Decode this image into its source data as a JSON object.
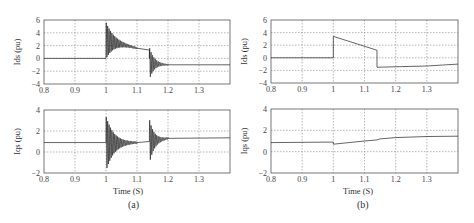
{
  "chart_data": [
    {
      "id": "a-ids",
      "panel": "(a)",
      "type": "line",
      "ylabel": "Ids (pu)",
      "xlabel": "",
      "xlim": [
        0.8,
        1.4
      ],
      "ylim": [
        -4,
        6
      ],
      "xticks": [
        0.8,
        0.9,
        1,
        1.1,
        1.2,
        1.3
      ],
      "xtick_labels": [
        "0.8",
        "0.9",
        "1",
        "1.1",
        "1.2",
        "1.3"
      ],
      "yticks": [
        -4,
        -2,
        0,
        2,
        4,
        6
      ],
      "grid": true,
      "box": {
        "x": 44,
        "y": 20,
        "w": 186,
        "h": 64
      },
      "description": "Steady 0 until t=1.0; oscillation (peaks ~5.5 / ~0) decaying around a line from ~3.5 to ~1.5 by t≈1.1; ramp to ~1.3 at t≈1.14; then oscillation down to ~-3.5 decaying to ~-1.0 by t≈1.2; flat ~-1.0 to 1.4",
      "segments": [
        {
          "kind": "line",
          "points": [
            [
              0.8,
              0
            ],
            [
              1.0,
              0
            ]
          ]
        },
        {
          "kind": "osc",
          "t0": 1.0,
          "t1": 1.1,
          "start_center": 2.8,
          "end_center": 1.6,
          "amp0": 2.8,
          "amp1": 0.1,
          "freq": 220
        },
        {
          "kind": "line",
          "points": [
            [
              1.1,
              1.6
            ],
            [
              1.14,
              1.3
            ]
          ]
        },
        {
          "kind": "osc",
          "t0": 1.14,
          "t1": 1.2,
          "start_center": -0.8,
          "end_center": -1.0,
          "amp0": 2.5,
          "amp1": 0.05,
          "freq": 220
        },
        {
          "kind": "line",
          "points": [
            [
              1.2,
              -1.0
            ],
            [
              1.4,
              -1.0
            ]
          ]
        }
      ]
    },
    {
      "id": "a-iqs",
      "panel": "(a)",
      "type": "line",
      "ylabel": "Iqs (pu)",
      "xlabel": "Time (S)",
      "xlim": [
        0.8,
        1.4
      ],
      "ylim": [
        -2,
        4
      ],
      "xticks": [
        0.8,
        0.9,
        1,
        1.1,
        1.2,
        1.3
      ],
      "xtick_labels": [
        "0.8",
        "0.9",
        "1",
        "1.1",
        "1.2",
        "1.3"
      ],
      "yticks": [
        -2,
        0,
        2,
        4
      ],
      "grid": true,
      "box": {
        "x": 44,
        "y": 110,
        "w": 186,
        "h": 63
      },
      "description": "Steady ~0.9 until t=1.0; oscillation (peaks ~3.4 / ~-1.8) decaying to ~0.9 by t≈1.1; flat to 1.14; oscillation (peaks ~3.1 / ~-1.2) decaying to ~1.3 by 1.2; ~1.35 to 1.4",
      "segments": [
        {
          "kind": "line",
          "points": [
            [
              0.8,
              0.9
            ],
            [
              1.0,
              0.9
            ]
          ]
        },
        {
          "kind": "osc",
          "t0": 1.0,
          "t1": 1.1,
          "start_center": 0.8,
          "end_center": 0.9,
          "amp0": 2.6,
          "amp1": 0.05,
          "freq": 220
        },
        {
          "kind": "line",
          "points": [
            [
              1.1,
              0.9
            ],
            [
              1.14,
              1.0
            ]
          ]
        },
        {
          "kind": "osc",
          "t0": 1.14,
          "t1": 1.2,
          "start_center": 1.0,
          "end_center": 1.3,
          "amp0": 2.1,
          "amp1": 0.05,
          "freq": 220
        },
        {
          "kind": "line",
          "points": [
            [
              1.2,
              1.3
            ],
            [
              1.4,
              1.35
            ]
          ]
        }
      ]
    },
    {
      "id": "b-ids",
      "panel": "(b)",
      "type": "line",
      "ylabel": "Ids (pu)",
      "xlabel": "",
      "xlim": [
        0.8,
        1.4
      ],
      "ylim": [
        -4,
        6
      ],
      "xticks": [
        0.8,
        0.9,
        1,
        1.1,
        1.2,
        1.3
      ],
      "xtick_labels": [
        "0.8",
        "0.9",
        "1",
        "1.1",
        "1.2",
        "1.3"
      ],
      "yticks": [
        -4,
        -2,
        0,
        2,
        4,
        6
      ],
      "grid": true,
      "box": {
        "x": 271,
        "y": 20,
        "w": 187,
        "h": 63
      },
      "description": "0 until 1.0; step to ~3.4; linear decay to ~1.2 at 1.14; step down to ~-1.5; slow rise to ~-1.0 at 1.4",
      "segments": [
        {
          "kind": "line",
          "points": [
            [
              0.8,
              0
            ],
            [
              1.0,
              0
            ],
            [
              1.0,
              3.4
            ],
            [
              1.14,
              1.2
            ],
            [
              1.14,
              -1.5
            ],
            [
              1.3,
              -1.3
            ],
            [
              1.4,
              -1.0
            ]
          ]
        }
      ]
    },
    {
      "id": "b-iqs",
      "panel": "(b)",
      "type": "line",
      "ylabel": "Iqs (pu)",
      "xlabel": "Time (S)",
      "xlim": [
        0.8,
        1.4
      ],
      "ylim": [
        -2,
        4
      ],
      "xticks": [
        0.8,
        0.9,
        1,
        1.1,
        1.2,
        1.3
      ],
      "xtick_labels": [
        "0.8",
        "0.9",
        "1",
        "1.1",
        "1.2",
        "1.3"
      ],
      "yticks": [
        -2,
        0,
        2,
        4
      ],
      "grid": true,
      "box": {
        "x": 271,
        "y": 109,
        "w": 187,
        "h": 64
      },
      "description": "~0.85 until 1.0; dip to ~0.7; smooth rise to ~1.3 at 1.2 and ~1.45 at 1.4",
      "segments": [
        {
          "kind": "line",
          "points": [
            [
              0.8,
              0.85
            ],
            [
              1.0,
              0.9
            ],
            [
              1.0,
              0.7
            ],
            [
              1.1,
              1.0
            ],
            [
              1.14,
              1.1
            ],
            [
              1.15,
              1.2
            ],
            [
              1.2,
              1.32
            ],
            [
              1.3,
              1.42
            ],
            [
              1.4,
              1.45
            ]
          ]
        }
      ]
    }
  ],
  "captions": {
    "a": "(a)",
    "b": "(b)"
  },
  "xlabel_text": "Time (S)",
  "ylabels": {
    "ids": "Ids (pu)",
    "iqs": "Iqs (pu)"
  }
}
